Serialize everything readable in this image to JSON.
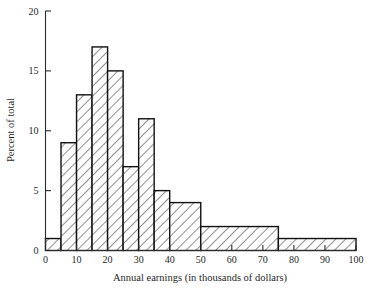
{
  "chart_data": {
    "type": "bar",
    "title": "",
    "subtitle": "",
    "xlabel": "Annual earnings (in thousands of dollars)",
    "ylabel": "Percent of total",
    "xlim": [
      0,
      100
    ],
    "ylim": [
      0,
      20
    ],
    "grid": false,
    "legend": null,
    "legend_position": "none",
    "x_ticks": [
      0,
      10,
      20,
      30,
      40,
      50,
      60,
      70,
      80,
      90,
      100
    ],
    "x_tick_labels": [
      "0",
      "10",
      "20",
      "30",
      "40",
      "50",
      "60",
      "70",
      "80",
      "90",
      "100"
    ],
    "y_ticks": [
      0,
      5,
      10,
      15,
      20
    ],
    "y_tick_labels": [
      "0",
      "5",
      "10",
      "15",
      "20"
    ],
    "bin_edges": [
      0,
      5,
      10,
      15,
      20,
      25,
      30,
      35,
      40,
      50,
      75,
      100
    ],
    "categories": [
      "0-5",
      "5-10",
      "10-15",
      "15-20",
      "20-25",
      "25-30",
      "30-35",
      "35-40",
      "40-50",
      "50-75",
      "75-100"
    ],
    "values": [
      1,
      9,
      13,
      17,
      15,
      7,
      11,
      5,
      4,
      2,
      1
    ],
    "bars": [
      {
        "x0": 0,
        "x1": 5,
        "height": 1
      },
      {
        "x0": 5,
        "x1": 10,
        "height": 9
      },
      {
        "x0": 10,
        "x1": 15,
        "height": 13
      },
      {
        "x0": 15,
        "x1": 20,
        "height": 17
      },
      {
        "x0": 20,
        "x1": 25,
        "height": 15
      },
      {
        "x0": 25,
        "x1": 30,
        "height": 7
      },
      {
        "x0": 30,
        "x1": 35,
        "height": 11
      },
      {
        "x0": 35,
        "x1": 40,
        "height": 5
      },
      {
        "x0": 40,
        "x1": 50,
        "height": 4
      },
      {
        "x0": 50,
        "x1": 75,
        "height": 2
      },
      {
        "x0": 75,
        "x1": 100,
        "height": 1
      }
    ],
    "colors": {
      "bar_outline": "#111111",
      "bar_fill": "#ffffff",
      "hatch": "#2b2b2b",
      "axis": "#2a2a2a",
      "text": "#1f1f1f",
      "background": "#ffffff"
    }
  }
}
